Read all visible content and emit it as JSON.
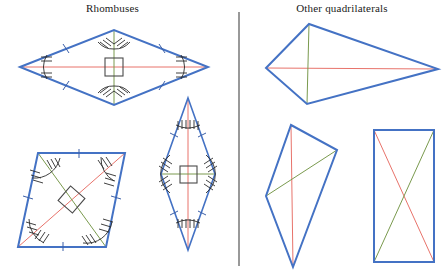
{
  "figure": {
    "type": "geometry-classification-diagram",
    "canvas": {
      "width": 444,
      "height": 272
    },
    "colors": {
      "shape_outline": "#4472c4",
      "diagonal_red": "#e8736b",
      "diagonal_green": "#7a9a4e",
      "mark_ink": "#2b2b2b",
      "right_angle_box": "#4a4a4a",
      "divider": "#555555",
      "background": "#ffffff",
      "title_text": "#1a1a1a"
    }
  },
  "headings": {
    "left": "Rhombuses",
    "right": "Other quadrilaterals"
  },
  "divider": {
    "name": "vertical-divider",
    "x": 239,
    "y1": 12,
    "y2": 266
  },
  "left_panel": {
    "label": "Rhombuses",
    "shapes": [
      {
        "name": "wide-horizontal-rhombus",
        "points": "20,67 114,30 208,67 114,105",
        "diagonals": [
          {
            "color": "red",
            "line": "20,67 208,67"
          },
          {
            "color": "green",
            "line": "114,30 114,105"
          }
        ],
        "right_angle_box": {
          "cx": 114,
          "cy": 67,
          "size": 18
        },
        "side_ticks": 1,
        "angle_hashes": 3
      },
      {
        "name": "slanted-rhombus",
        "points": "38,153 125,153 106,247 18,247",
        "diagonals": [
          {
            "color": "red",
            "line": "18,247 125,153"
          },
          {
            "color": "green",
            "line": "38,153 106,247"
          }
        ],
        "right_angle_box": {
          "cx": 71.75,
          "cy": 200,
          "size": 19,
          "rotated": true
        },
        "side_ticks": 1,
        "angle_hashes": 3
      },
      {
        "name": "tall-vertical-rhombus",
        "points": "188,98 215,174 188,250 161,174",
        "diagonals": [
          {
            "color": "red",
            "line": "188,98 188,250"
          },
          {
            "color": "green",
            "line": "161,174 215,174"
          }
        ],
        "right_angle_box": {
          "cx": 188,
          "cy": 174,
          "size": 17
        },
        "side_ticks": 1,
        "angle_hashes": 3
      }
    ]
  },
  "right_panel": {
    "label": "Other quadrilaterals",
    "shapes": [
      {
        "name": "kite-quadrilateral",
        "points": "266,68 309,24 438,69 307,104",
        "diagonals": [
          {
            "color": "red",
            "line": "266,68 438,69"
          },
          {
            "color": "green",
            "line": "309,24 307,104"
          }
        ],
        "right_angle_box": null
      },
      {
        "name": "irregular-quadrilateral",
        "points": "291,125 337,150 293,267 266,196",
        "diagonals": [
          {
            "color": "red",
            "line": "291,125 293,267"
          },
          {
            "color": "green",
            "line": "337,150 266,196"
          }
        ],
        "right_angle_box": null
      },
      {
        "name": "rectangle-quadrilateral",
        "points": "374,130 434,130 434,262 374,262",
        "diagonals": [
          {
            "color": "red",
            "line": "374,130 434,262"
          },
          {
            "color": "green",
            "line": "434,130 374,262"
          }
        ],
        "right_angle_box": null
      }
    ]
  }
}
